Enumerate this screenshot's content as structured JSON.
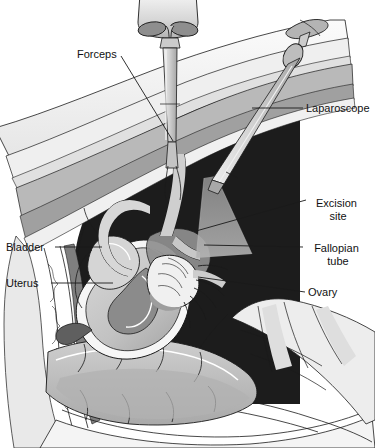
{
  "figure": {
    "width": 375,
    "height": 448,
    "background_color": "#ffffff"
  },
  "labels": [
    {
      "id": "forceps",
      "text": "Forceps",
      "lines": [
        "Forceps"
      ],
      "align": "start",
      "x": 77,
      "y": 58,
      "leader": {
        "x1": 121,
        "y1": 56,
        "x2": 173,
        "y2": 141
      }
    },
    {
      "id": "laparoscope",
      "text": "Laparoscope",
      "lines": [
        "Laparoscope"
      ],
      "align": "start",
      "x": 306,
      "y": 112,
      "leader": {
        "x1": 252,
        "y1": 108,
        "x2": 303,
        "y2": 108
      }
    },
    {
      "id": "excision-site",
      "text": "Excision site",
      "lines": [
        "Excision",
        "site"
      ],
      "align": "middle",
      "x": 338,
      "y": 207,
      "leader": {
        "x1": 196,
        "y1": 231,
        "x2": 306,
        "y2": 200
      }
    },
    {
      "id": "fallopian-tube",
      "text": "Fallopian tube",
      "lines": [
        "Fallopian",
        "tube"
      ],
      "align": "middle",
      "x": 338,
      "y": 252,
      "leader": {
        "x1": 204,
        "y1": 245,
        "x2": 303,
        "y2": 247
      }
    },
    {
      "id": "ovary",
      "text": "Ovary",
      "lines": [
        "Ovary"
      ],
      "align": "start",
      "x": 308,
      "y": 296,
      "leader": {
        "x1": 198,
        "y1": 277,
        "x2": 305,
        "y2": 292
      }
    },
    {
      "id": "bladder",
      "text": "Bladder",
      "lines": [
        "Bladder"
      ],
      "align": "start",
      "x": 6,
      "y": 251,
      "leader": {
        "x1": 55,
        "y1": 247,
        "x2": 102,
        "y2": 247
      }
    },
    {
      "id": "uterus",
      "text": "Uterus",
      "lines": [
        "Uterus"
      ],
      "align": "start",
      "x": 6,
      "y": 287,
      "leader": {
        "x1": 51,
        "y1": 283,
        "x2": 113,
        "y2": 283
      }
    }
  ],
  "palette": {
    "line": "#1a1a1a",
    "cavity_dark": "#1c1c1c",
    "skin_light": "#f2f2f2",
    "fat_layer": "#e3e3e3",
    "muscle_mid": "#b8b8b8",
    "muscle_dark": "#9a9a9a",
    "organ_light": "#d9d9d9",
    "organ_mid": "#bdbdbd",
    "organ_dark": "#8d8d8d",
    "instrument": "#cfcfcf",
    "instrument_shadow": "#9d9d9d",
    "bone": "#ededed",
    "light_cone": "#9b9b9b",
    "white": "#ffffff",
    "text": "#111111"
  },
  "structures": [
    {
      "id": "abdominal-wall",
      "name": "abdominal wall layers"
    },
    {
      "id": "peritoneal-cavity",
      "name": "peritoneal cavity"
    },
    {
      "id": "uterus-body",
      "name": "uterus"
    },
    {
      "id": "bladder-body",
      "name": "bladder"
    },
    {
      "id": "fallopian-tube-body",
      "name": "fallopian tube"
    },
    {
      "id": "ovary-body",
      "name": "ovary"
    },
    {
      "id": "fimbriae",
      "name": "fimbriae"
    },
    {
      "id": "rectum-body",
      "name": "rectum"
    },
    {
      "id": "sacrum",
      "name": "sacrum / vertebrae"
    },
    {
      "id": "forceps-instrument",
      "name": "forceps"
    },
    {
      "id": "laparoscope-instrument",
      "name": "laparoscope"
    },
    {
      "id": "excision-light-cone",
      "name": "laparoscope light cone at excision site"
    }
  ]
}
